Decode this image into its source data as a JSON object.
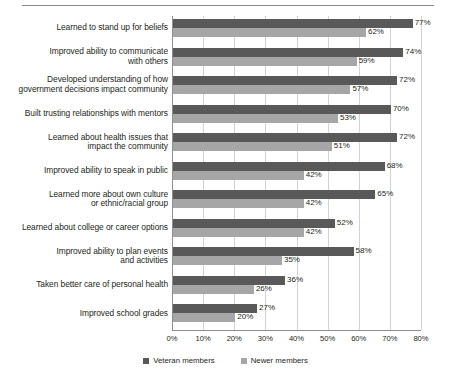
{
  "chart_data": {
    "type": "bar",
    "orientation": "horizontal",
    "title": "",
    "xlabel": "",
    "ylabel": "",
    "xlim": [
      0,
      80
    ],
    "xticks": [
      0,
      10,
      20,
      30,
      40,
      50,
      60,
      70,
      80
    ],
    "xtick_labels": [
      "0%",
      "10%",
      "20%",
      "30%",
      "40%",
      "50%",
      "60%",
      "70%",
      "80%"
    ],
    "grid": true,
    "grid_axis": "x",
    "legend_position": "bottom",
    "value_label_suffix": "%",
    "categories": [
      "Learned to stand up for beliefs",
      "Improved ability to communicate with others",
      "Developed  understanding of how government decisions impact community",
      "Built trusting relationships with mentors",
      "Learned about health issues that impact the community",
      "Improved ability to speak in public",
      "Learned more about own culture or ethnic/racial group",
      "Learned about college or career options",
      "Improved ability to plan events and activities",
      "Taken better care of personal health",
      "Improved school grades"
    ],
    "category_lines": [
      [
        "Learned to stand up for beliefs"
      ],
      [
        "Improved ability to communicate",
        "with others"
      ],
      [
        "Developed  understanding of how",
        "government decisions impact community"
      ],
      [
        "Built trusting relationships with mentors"
      ],
      [
        "Learned about health issues that",
        "impact the community"
      ],
      [
        "Improved ability to speak in public"
      ],
      [
        "Learned more about own culture",
        "or ethnic/racial group"
      ],
      [
        "Learned about college or career options"
      ],
      [
        "Improved ability to plan events",
        "and activities"
      ],
      [
        "Taken better care of personal health"
      ],
      [
        "Improved school grades"
      ]
    ],
    "series": [
      {
        "name": "Veteran members",
        "color": "#595959",
        "values": [
          77,
          74,
          72,
          70,
          72,
          68,
          65,
          52,
          58,
          36,
          27
        ],
        "labels": [
          "77%",
          "74%",
          "72%",
          "70%",
          "72%",
          "68%",
          "65%",
          "52%",
          "58%",
          "36%",
          "27%"
        ]
      },
      {
        "name": "Newer members",
        "color": "#a6a6a6",
        "values": [
          62,
          59,
          57,
          53,
          51,
          42,
          42,
          42,
          35,
          26,
          20
        ],
        "labels": [
          "62%",
          "59%",
          "57%",
          "53%",
          "51%",
          "42%",
          "42%",
          "42%",
          "35%",
          "26%",
          "20%"
        ]
      }
    ]
  },
  "legend": {
    "items": [
      {
        "label": "Veteran members"
      },
      {
        "label": "Newer members"
      }
    ]
  },
  "header": {
    "clipped_text": ""
  }
}
